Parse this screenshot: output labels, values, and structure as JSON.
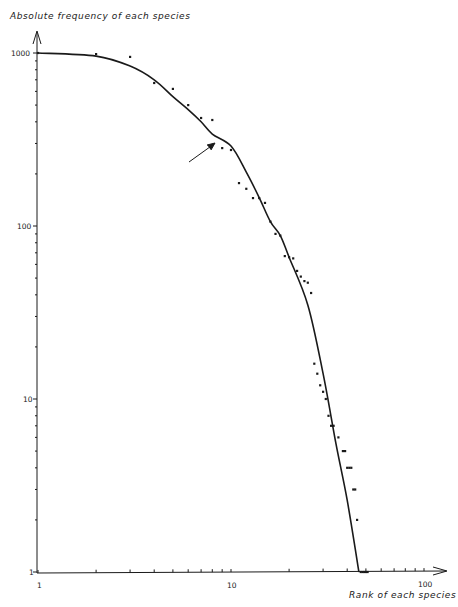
{
  "chart_data": {
    "type": "scatter",
    "title": "",
    "xlabel": "Rank of each species",
    "ylabel": "Absolute frequency of each species",
    "xscale": "log",
    "yscale": "log",
    "xlim": [
      1,
      130
    ],
    "ylim": [
      1,
      1300
    ],
    "grid": false,
    "legend": null,
    "x_ticks": [
      1,
      10,
      100
    ],
    "x_tick_labels": [
      "1",
      "10",
      "100"
    ],
    "y_ticks": [
      1,
      10,
      100,
      1000
    ],
    "y_tick_labels": [
      "1",
      "10",
      "100",
      "1000"
    ],
    "series": [
      {
        "name": "observed",
        "kind": "points",
        "points": [
          [
            1,
            1000
          ],
          [
            2,
            986
          ],
          [
            3,
            950
          ],
          [
            4,
            671
          ],
          [
            5,
            620
          ],
          [
            6,
            500
          ],
          [
            7,
            421
          ],
          [
            8,
            410
          ],
          [
            9,
            282
          ],
          [
            10,
            275
          ],
          [
            11,
            177
          ],
          [
            12,
            164
          ],
          [
            13,
            145
          ],
          [
            14,
            145
          ],
          [
            15,
            136
          ],
          [
            16,
            106
          ],
          [
            17,
            90
          ],
          [
            18,
            88
          ],
          [
            19,
            67
          ],
          [
            20,
            66
          ],
          [
            21,
            65
          ],
          [
            22,
            55
          ],
          [
            23,
            51
          ],
          [
            24,
            48
          ],
          [
            25,
            47
          ],
          [
            26,
            41
          ],
          [
            27,
            16
          ],
          [
            28,
            14
          ],
          [
            29,
            12
          ],
          [
            30,
            11
          ],
          [
            31,
            10
          ],
          [
            32,
            8
          ],
          [
            33,
            7
          ],
          [
            34,
            7
          ],
          [
            36,
            6
          ],
          [
            38,
            5
          ],
          [
            39,
            5
          ],
          [
            40,
            4
          ],
          [
            41,
            4
          ],
          [
            42,
            4
          ],
          [
            43,
            3
          ],
          [
            44,
            3
          ],
          [
            45,
            2
          ],
          [
            47,
            1
          ],
          [
            48,
            1
          ],
          [
            49,
            1
          ],
          [
            50,
            1
          ],
          [
            51,
            1
          ]
        ]
      },
      {
        "name": "fitted curve",
        "kind": "line",
        "points": [
          [
            1,
            1000
          ],
          [
            2,
            960
          ],
          [
            3,
            840
          ],
          [
            4,
            700
          ],
          [
            5,
            560
          ],
          [
            6,
            470
          ],
          [
            7,
            400
          ],
          [
            8,
            340
          ],
          [
            10,
            290
          ],
          [
            12,
            205
          ],
          [
            14,
            146
          ],
          [
            16,
            106
          ],
          [
            18,
            88
          ],
          [
            20,
            66
          ],
          [
            25,
            35
          ],
          [
            30,
            14
          ],
          [
            35,
            5.5
          ],
          [
            40,
            2.6
          ],
          [
            46,
            1
          ]
        ]
      }
    ],
    "annotations": [
      {
        "type": "arrow",
        "from_rank": 6,
        "from_freq": 220,
        "to_rank": 8.5,
        "to_freq": 290,
        "note": "arrow pointing at curve near rank 9"
      }
    ]
  },
  "labels": {
    "ylabel": "Absolute frequency of each species",
    "xlabel": "Rank of each species",
    "y1000": "1000",
    "y100": "100",
    "y10": "10",
    "y1": "1",
    "x1": "1",
    "x10": "10",
    "x100": "100"
  },
  "colors": {
    "ink": "#1a1a1a",
    "background": "#ffffff"
  }
}
